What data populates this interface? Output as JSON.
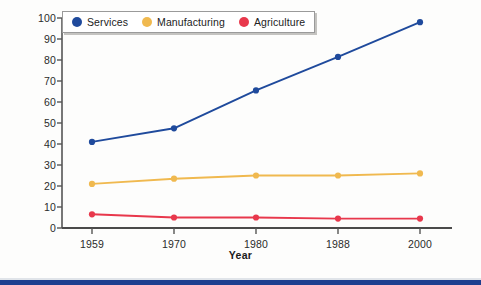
{
  "chart_data": {
    "type": "line",
    "title": "",
    "xlabel": "Year",
    "ylabel": "",
    "categories": [
      "1959",
      "1970",
      "1980",
      "1988",
      "2000"
    ],
    "x": [
      1959,
      1970,
      1980,
      1988,
      2000
    ],
    "ylim": [
      0,
      100
    ],
    "yticks": [
      "0",
      "10",
      "20",
      "30",
      "40",
      "50",
      "60",
      "70",
      "80",
      "90",
      "100"
    ],
    "grid": false,
    "legend_position": "top-left",
    "series": [
      {
        "name": "Services",
        "color": "#1f4a9c",
        "values": [
          41,
          47.5,
          65.5,
          81.5,
          98
        ]
      },
      {
        "name": "Manufacturing",
        "color": "#f0b94f",
        "values": [
          21,
          23.5,
          25,
          25,
          26
        ]
      },
      {
        "name": "Agriculture",
        "color": "#e8384c",
        "values": [
          6.5,
          5,
          5,
          4.5,
          4.5
        ]
      }
    ]
  },
  "legend": {
    "items": [
      {
        "label": "Services"
      },
      {
        "label": "Manufacturing"
      },
      {
        "label": "Agriculture"
      }
    ]
  },
  "axes": {
    "x_title": "Year"
  }
}
